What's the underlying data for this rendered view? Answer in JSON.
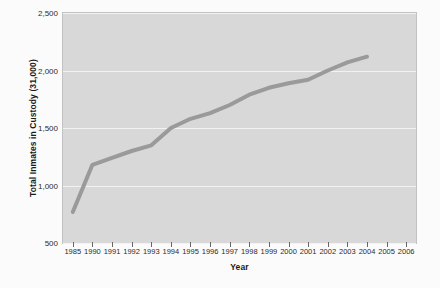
{
  "chart_data": {
    "type": "line",
    "title": "",
    "xlabel": "Year",
    "ylabel": "Total Inmates in Custody (31,000)",
    "grid": true,
    "legend": "none",
    "xlim": [
      1985,
      2006
    ],
    "ylim": [
      500,
      2500
    ],
    "y_ticks": [
      2500,
      2000,
      1500,
      1000,
      500
    ],
    "y_tick_labels": [
      "2,500",
      "2,000",
      "1,500",
      "1,000",
      "500"
    ],
    "x_tick_labels": [
      "1985",
      "1990",
      "1991",
      "1992",
      "1993",
      "1994",
      "1995",
      "1996",
      "1997",
      "1998",
      "1999",
      "2000",
      "2001",
      "2002",
      "2003",
      "2004",
      "2005",
      "2006"
    ],
    "categories": [
      "1985",
      "1990",
      "1991",
      "1992",
      "1993",
      "1994",
      "1995",
      "1996",
      "1997",
      "1998",
      "1999",
      "2000",
      "2001",
      "2002",
      "2003",
      "2004"
    ],
    "series": [
      {
        "name": "Total Inmates in Custody",
        "color": "#9a9a9a",
        "values": [
          770,
          1180,
          1240,
          1300,
          1350,
          1500,
          1580,
          1630,
          1700,
          1790,
          1850,
          1890,
          1920,
          2000,
          2070,
          2120
        ]
      }
    ],
    "colors": {
      "plot_background": "#d8d8d8",
      "page_background": "#fbfbfb",
      "gridline": "#f2f2f2",
      "line": "#9a9a9a",
      "axis_text": "#2b2b2b",
      "axis_title": "#1a1a1a",
      "plot_border": "#c2c2c2"
    }
  }
}
